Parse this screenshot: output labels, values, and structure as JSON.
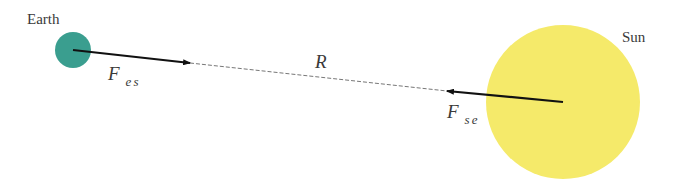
{
  "diagram": {
    "title": "",
    "bodies": {
      "earth": {
        "label": "Earth",
        "color": "#3a9e8f",
        "cx": 73,
        "cy": 50,
        "r": 18
      },
      "sun": {
        "label": "Sun",
        "color": "#f5ea6a",
        "cx": 563,
        "cy": 102,
        "r": 77
      }
    },
    "forces": {
      "fes": {
        "symbol": "F",
        "subscript": "es",
        "description": "force on Earth by Sun"
      },
      "fse": {
        "symbol": "F",
        "subscript": "se",
        "description": "force on Sun by Earth"
      }
    },
    "distance": {
      "symbol": "R"
    },
    "colors": {
      "arrow": "#111111",
      "dashed_line": "#777777",
      "text": "#3a3a3a"
    }
  }
}
